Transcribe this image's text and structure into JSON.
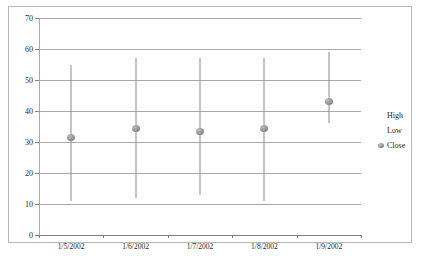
{
  "chart_data": {
    "type": "line",
    "subtype": "high-low-close",
    "title": "",
    "xlabel": "",
    "ylabel": "",
    "categories": [
      "1/5/2002",
      "1/6/2002",
      "1/7/2002",
      "1/8/2002",
      "1/9/2002"
    ],
    "series": [
      {
        "name": "High",
        "values": [
          55,
          57,
          57,
          57,
          59
        ]
      },
      {
        "name": "Low",
        "values": [
          11,
          12,
          13,
          11,
          36
        ]
      },
      {
        "name": "Close",
        "values": [
          31.5,
          34.5,
          33.5,
          34.5,
          43
        ]
      }
    ],
    "ylim": [
      0,
      70
    ],
    "ytick_step": 10,
    "yticks": [
      70,
      60,
      50,
      40,
      30,
      20,
      10,
      0
    ],
    "grid": true,
    "legend_position": "right",
    "legend": [
      "High",
      "Low",
      "Close"
    ],
    "colors": {
      "bar": "#8c8c8c",
      "marker": "#9a9a9a",
      "gridline": "#a9a9a9",
      "axis": "#7f7f7f",
      "border": "#b8b8b8",
      "text": "#262626",
      "background": "#ffffff"
    }
  },
  "legend": {
    "items": [
      {
        "label": "High",
        "marker": "line-swatch"
      },
      {
        "label": "Low",
        "marker": "line-swatch"
      },
      {
        "label": "Close",
        "marker": "dot-swatch"
      }
    ]
  }
}
